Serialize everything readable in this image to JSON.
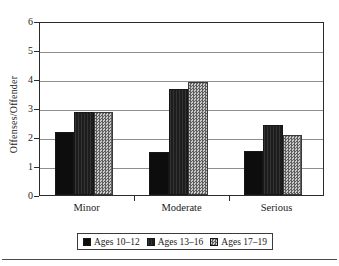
{
  "chart_data": {
    "type": "bar",
    "title": "",
    "subtitle": "",
    "xlabel": "",
    "ylabel": "Offenses/Offender",
    "categories": [
      "Minor",
      "Moderate",
      "Serious"
    ],
    "series": [
      {
        "name": "Ages 10–12",
        "values": [
          2.2,
          1.5,
          1.55
        ],
        "color": "#0d0d0d",
        "pattern": "solid-black"
      },
      {
        "name": "Ages 13–16",
        "values": [
          2.9,
          3.7,
          2.45
        ],
        "color": "#1d1d1d",
        "pattern": "dense-vertical-hatch"
      },
      {
        "name": "Ages 17–19",
        "values": [
          2.9,
          3.95,
          2.1
        ],
        "color": "#9a9a9a",
        "pattern": "gray-checker"
      }
    ],
    "ylim": [
      0,
      6
    ],
    "ytick_labels": [
      "0",
      "1",
      "2",
      "3",
      "4",
      "5",
      "6"
    ],
    "ytick_values": [
      0,
      1,
      2,
      3,
      4,
      5,
      6
    ],
    "grid": true,
    "grid_axis": "y",
    "legend_position": "bottom",
    "frame": true,
    "background": "#ffffff"
  },
  "legend": {
    "entries": [
      {
        "label": "Ages 10–12"
      },
      {
        "label": "Ages 13–16"
      },
      {
        "label": "Ages 17–19"
      }
    ]
  }
}
